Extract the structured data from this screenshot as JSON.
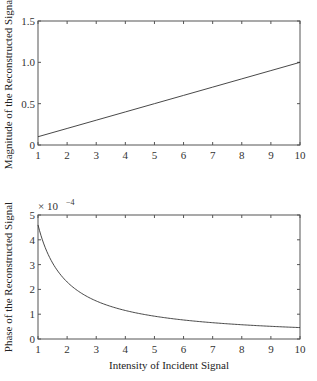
{
  "chart_data": [
    {
      "type": "line",
      "title": "",
      "xlabel": "",
      "ylabel": "Magnitude of the Reconstructed Signal",
      "xlim": [
        1,
        10
      ],
      "ylim": [
        0,
        1.5
      ],
      "xticks": [
        "1",
        "2",
        "3",
        "4",
        "5",
        "6",
        "7",
        "8",
        "9",
        "10"
      ],
      "yticks": [
        "0",
        "0.5",
        "1.0",
        "1.5"
      ],
      "grid": false,
      "series": [
        {
          "name": "magnitude",
          "x": [
            1,
            2,
            3,
            4,
            5,
            6,
            7,
            8,
            9,
            10
          ],
          "values": [
            0.1,
            0.2,
            0.3,
            0.4,
            0.5,
            0.6,
            0.7,
            0.8,
            0.9,
            1.0
          ]
        }
      ]
    },
    {
      "type": "line",
      "title": "",
      "xlabel": "Intensity of Incident Signal",
      "ylabel": "Phase of the Reconstructed Signal",
      "y_multiplier": "× 10^-4",
      "xlim": [
        1,
        10
      ],
      "ylim": [
        0,
        5
      ],
      "xticks": [
        "1",
        "2",
        "3",
        "4",
        "5",
        "6",
        "7",
        "8",
        "9",
        "10"
      ],
      "yticks": [
        "0",
        "1",
        "2",
        "3",
        "4",
        "5"
      ],
      "grid": false,
      "series": [
        {
          "name": "phase (×1e-4)",
          "x": [
            1,
            1.5,
            2,
            2.5,
            3,
            4,
            5,
            6,
            7,
            8,
            9,
            10
          ],
          "values": [
            4.6,
            3.07,
            2.3,
            1.84,
            1.53,
            1.15,
            0.92,
            0.77,
            0.66,
            0.58,
            0.51,
            0.46
          ]
        }
      ]
    }
  ],
  "labels": {
    "top_ylabel": "Magnitude of the Reconstructed Signal",
    "bottom_ylabel": "Phase of the Reconstructed Signal",
    "bottom_xlabel": "Intensity of Incident Signal",
    "multiplier_base": "× 10",
    "multiplier_exp": "−4"
  }
}
